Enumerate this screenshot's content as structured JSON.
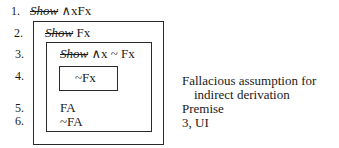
{
  "lines": [
    {
      "number": "1.",
      "show": "Show",
      "formula": " ∧xFx",
      "justification": ""
    },
    {
      "number": "2.",
      "show": "Show",
      "formula": " Fx",
      "justification": ""
    },
    {
      "number": "3.",
      "show": "Show",
      "formula": " ∧x ~ Fx",
      "justification": ""
    },
    {
      "number": "4.",
      "show": "",
      "formula": "~Fx",
      "justification": "Fallacious assumption for",
      "justification_cont": "indirect derivation"
    },
    {
      "number": "5.",
      "show": "",
      "formula": "FA",
      "justification": "Premise"
    },
    {
      "number": "6.",
      "show": "",
      "formula": "~FA",
      "justification": "3, UI"
    }
  ]
}
